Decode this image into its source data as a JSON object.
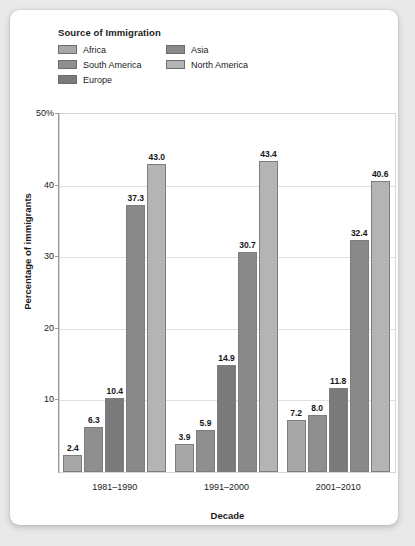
{
  "legend": {
    "title": "Source of Immigration",
    "entries": [
      {
        "label": "Africa",
        "color": "#a8a8a8"
      },
      {
        "label": "Asia",
        "color": "#8a8a8a"
      },
      {
        "label": "South America",
        "color": "#8f8f8f"
      },
      {
        "label": "North America",
        "color": "#b4b4b4"
      },
      {
        "label": "Europe",
        "color": "#7a7a7a"
      }
    ]
  },
  "chart_data": {
    "type": "bar",
    "title": "",
    "xlabel": "Decade",
    "ylabel": "Percentage of immigrants",
    "categories": [
      "1981–1990",
      "1991–2000",
      "2001–2010"
    ],
    "series": [
      {
        "name": "Africa",
        "color": "#a8a8a8",
        "values": [
          2.4,
          3.9,
          7.2
        ]
      },
      {
        "name": "South America",
        "color": "#8f8f8f",
        "values": [
          6.3,
          5.9,
          8.0
        ]
      },
      {
        "name": "Europe",
        "color": "#7a7a7a",
        "values": [
          10.4,
          14.9,
          11.8
        ]
      },
      {
        "name": "Asia",
        "color": "#8a8a8a",
        "values": [
          37.3,
          30.7,
          32.4
        ]
      },
      {
        "name": "North America",
        "color": "#b4b4b4",
        "values": [
          43.0,
          43.4,
          40.6
        ]
      }
    ],
    "value_labels": [
      [
        "2.4",
        "6.3",
        "10.4",
        "37.3",
        "43.0"
      ],
      [
        "3.9",
        "5.9",
        "14.9",
        "30.7",
        "43.4"
      ],
      [
        "7.2",
        "8.0",
        "11.8",
        "32.4",
        "40.6"
      ]
    ],
    "ylim": [
      0,
      50
    ],
    "yticks": [
      10,
      20,
      30,
      40,
      50
    ],
    "ytick_labels": [
      "10",
      "20",
      "30",
      "40",
      "50%"
    ],
    "grid": true,
    "legend_position": "top-left"
  }
}
